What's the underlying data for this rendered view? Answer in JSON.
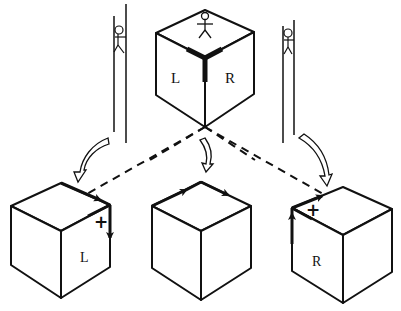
{
  "diagram": {
    "colors": {
      "ink": "#111111",
      "background": "#ffffff"
    },
    "top_cube": {
      "face_labels": {
        "left": "L",
        "right": "R"
      },
      "figure": "stick-figure-standing-on-top"
    },
    "observers": [
      {
        "side": "left",
        "figure": "stick-figure-climbing-pole"
      },
      {
        "side": "right",
        "figure": "stick-figure-climbing-pole"
      }
    ],
    "views": [
      {
        "position": "bottom-left",
        "face_label": "L",
        "sign": "+"
      },
      {
        "position": "bottom-center",
        "face_label": "",
        "sign": ""
      },
      {
        "position": "bottom-right",
        "face_label": "R",
        "sign": "+"
      }
    ]
  }
}
